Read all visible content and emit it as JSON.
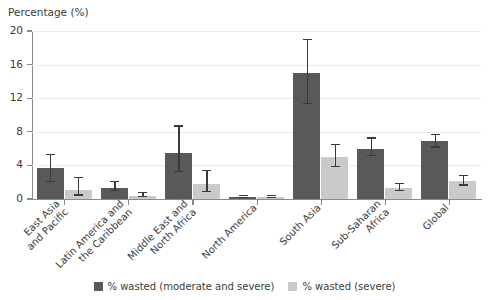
{
  "chart_data": {
    "type": "bar",
    "title": "",
    "ylabel": "Percentage (%)",
    "xlabel": "",
    "ylim": [
      0,
      20
    ],
    "yticks": [
      0,
      4,
      8,
      12,
      16,
      20
    ],
    "grid": true,
    "legend_position": "bottom",
    "categories": [
      "East Asia\nand Pacific",
      "Latin America and\nthe Caribbean",
      "Middle East and\nNorth Africa",
      "North America",
      "South Asia",
      "Sub-Saharan\nAfrica",
      "Global"
    ],
    "series": [
      {
        "name": "% wasted (moderate and severe)",
        "color": "#59595a",
        "values": [
          3.7,
          1.3,
          5.5,
          0.2,
          15.0,
          6.0,
          6.9
        ],
        "err_low": [
          2.0,
          0.9,
          3.2,
          0.1,
          11.3,
          5.1,
          6.1
        ],
        "err_high": [
          5.2,
          2.0,
          8.6,
          0.3,
          18.9,
          7.2,
          7.6
        ]
      },
      {
        "name": "% wasted (severe)",
        "color": "#c9c9c9",
        "values": [
          1.1,
          0.4,
          1.8,
          0.2,
          5.0,
          1.3,
          2.1
        ],
        "err_low": [
          0.4,
          0.2,
          0.8,
          0.1,
          3.8,
          0.9,
          1.6
        ],
        "err_high": [
          2.5,
          0.7,
          3.3,
          0.3,
          6.4,
          1.8,
          2.7
        ]
      }
    ]
  },
  "legend": {
    "items": [
      {
        "label": "% wasted (moderate and severe)"
      },
      {
        "label": "% wasted (severe)"
      }
    ]
  }
}
